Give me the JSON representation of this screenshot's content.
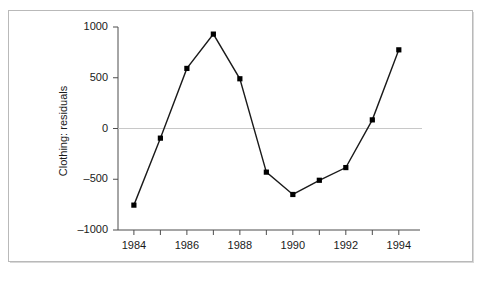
{
  "chart_data": {
    "type": "line",
    "title": "",
    "subtitle": "",
    "xlabel": "",
    "ylabel": "Clothing: residuals",
    "x": [
      1984,
      1985,
      1986,
      1987,
      1988,
      1989,
      1990,
      1991,
      1992,
      1993,
      1994
    ],
    "values": [
      -755,
      -95,
      592,
      930,
      490,
      -430,
      -650,
      -510,
      -385,
      85,
      775
    ],
    "series": [
      {
        "name": "Clothing: residuals",
        "values": [
          -755,
          -95,
          592,
          930,
          490,
          -430,
          -650,
          -510,
          -385,
          85,
          775
        ]
      }
    ],
    "xlim": [
      1983.4,
      1994.8
    ],
    "ylim": [
      -1000,
      1000
    ],
    "x_ticks": [
      1984,
      1985,
      1986,
      1987,
      1988,
      1989,
      1990,
      1991,
      1992,
      1993,
      1994
    ],
    "x_tick_labels": [
      "1984",
      "",
      "1986",
      "",
      "1988",
      "",
      "1990",
      "",
      "1992",
      "",
      "1994"
    ],
    "y_ticks": [
      -1000,
      -500,
      0,
      500,
      1000
    ],
    "y_tick_labels": [
      "–1000",
      "–500",
      "0",
      "500",
      "1000"
    ],
    "grid": false,
    "zero_line": true,
    "legend": "none",
    "marker": "filled-square",
    "line_color": "#1a1a1a",
    "marker_color": "#000000",
    "zero_line_color": "#c8c8c8",
    "axis_color": "#4d4d4d",
    "frame_color": "#b9b9b9",
    "background": "#ffffff"
  }
}
